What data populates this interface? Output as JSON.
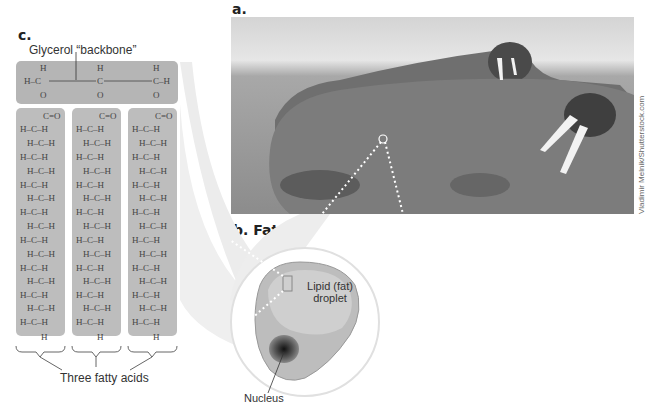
{
  "panels": {
    "a": {
      "label": "a."
    },
    "b": {
      "label": "b.",
      "title": "Fat cell"
    },
    "c": {
      "label": "c."
    }
  },
  "labels": {
    "glycerol": "Glycerol “backbone”",
    "fatty_acids": "Three fatty acids",
    "lipid_droplet_line1": "Lipid (fat)",
    "lipid_droplet_line2": "droplet",
    "nucleus": "Nucleus"
  },
  "photo_credit": "Vladimir Melnik/Shutterstock.com",
  "chemistry": {
    "glycerol_rows": [
      "H",
      "C",
      "O"
    ],
    "fatty_acid_head": "C=O",
    "fatty_acid_ch_rows": 15,
    "terminal": "H"
  },
  "colors": {
    "box_fill": "#b9b9b9",
    "box_border": "#9a9a9a",
    "cell_fill": "#c8c8c8",
    "nucleus": "#3a3a3a"
  }
}
